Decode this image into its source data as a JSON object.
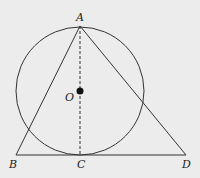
{
  "diagram": {
    "background": "#ececec",
    "stroke": "#333333",
    "points": {
      "A": {
        "label": "A",
        "x": 80,
        "y": 26
      },
      "B": {
        "label": "B",
        "x": 16,
        "y": 155
      },
      "C": {
        "label": "C",
        "x": 80,
        "y": 155
      },
      "D": {
        "label": "D",
        "x": 186,
        "y": 155
      },
      "O": {
        "label": "O",
        "x": 80,
        "y": 91
      }
    },
    "circle": {
      "center": "O",
      "radius": 64
    },
    "segments": [
      {
        "from": "A",
        "to": "B",
        "style": "solid"
      },
      {
        "from": "A",
        "to": "D",
        "style": "solid"
      },
      {
        "from": "B",
        "to": "D",
        "style": "solid"
      },
      {
        "from": "A",
        "to": "C",
        "style": "dashed"
      }
    ]
  }
}
